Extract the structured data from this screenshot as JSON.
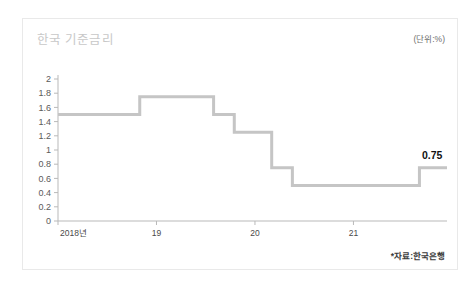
{
  "card": {
    "title": "한국 기준금리",
    "unit_label": "(단위:%)",
    "source_note": "*자료:한국은행"
  },
  "colors": {
    "line": "#c5c5c5",
    "title": "#c8c8c8",
    "axis": "#b9b9b9",
    "annotation": "#111111",
    "card_border": "#e9e9e9",
    "background": "#ffffff"
  },
  "chart_data": {
    "type": "line",
    "title": "한국 기준금리",
    "subtitle": "",
    "xlabel": "",
    "ylabel": "",
    "unit": "%",
    "source": "*자료:한국은행",
    "ylim": [
      0,
      2
    ],
    "ytick_labels": [
      "2",
      "1.8",
      "1.6",
      "1.4",
      "1.2",
      "1",
      "0.8",
      "0.6",
      "0.4",
      "0.2",
      "0"
    ],
    "ytick_values": [
      2,
      1.8,
      1.6,
      1.4,
      1.2,
      1,
      0.8,
      0.6,
      0.4,
      0.2,
      0
    ],
    "xtick_labels": [
      "2018년",
      "19",
      "20",
      "21"
    ],
    "xtick_values": [
      2018.0,
      2019.0,
      2020.0,
      2021.0
    ],
    "xlim": [
      2018.0,
      2021.95
    ],
    "grid": false,
    "legend": "none",
    "series": [
      {
        "name": "한국 기준금리",
        "step": "post",
        "x": [
          2018.0,
          2018.83,
          2019.58,
          2019.79,
          2020.17,
          2020.38,
          2021.67,
          2021.95
        ],
        "values": [
          1.5,
          1.75,
          1.5,
          1.25,
          0.75,
          0.5,
          0.75,
          0.75
        ]
      }
    ],
    "annotations": [
      {
        "label": "0.75",
        "x": 2021.8,
        "y": 0.75
      }
    ]
  }
}
